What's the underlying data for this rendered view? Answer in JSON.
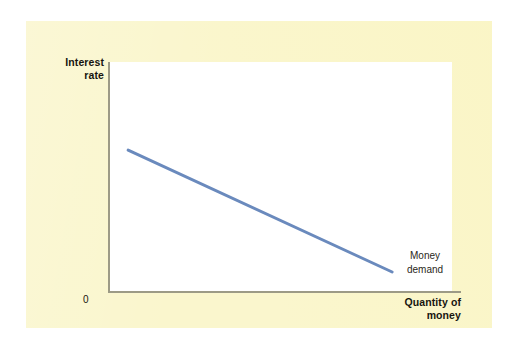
{
  "figure": {
    "background_color": "#faf6cd",
    "plot_background_color": "#ffffff",
    "axis_color": "#9c9a86"
  },
  "axes": {
    "y_title": "Interest\nrate",
    "x_title": "Quantity of\nmoney",
    "origin_label": "0"
  },
  "annotations": {
    "curve_label": "Money\ndemand"
  },
  "chart_data": {
    "type": "line",
    "title": "",
    "xlabel": "Quantity of money",
    "ylabel": "Interest rate",
    "grid": false,
    "legend": null,
    "xlim": [
      0,
      100
    ],
    "ylim": [
      0,
      100
    ],
    "axis_tick_labels": {
      "x": [],
      "y": [],
      "origin": "0"
    },
    "series": [
      {
        "name": "Money demand",
        "color": "#6a8abd",
        "line_width": 3,
        "x": [
          5.3,
          82.5
        ],
        "y": [
          61.7,
          8.7
        ],
        "annotation": "Money demand"
      }
    ]
  }
}
